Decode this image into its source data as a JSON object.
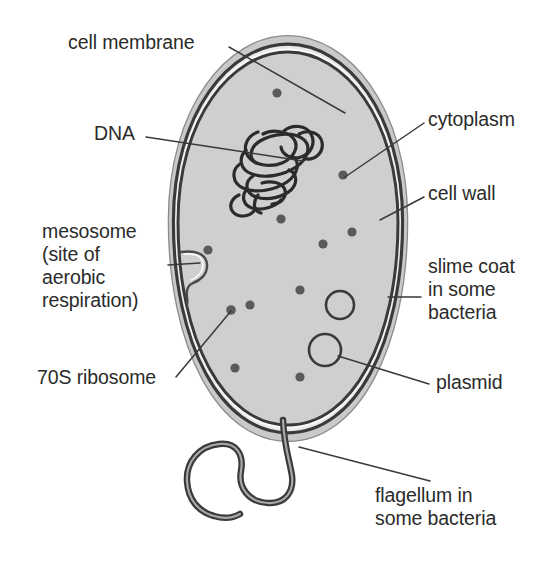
{
  "diagram": {
    "background_color": "#ffffff",
    "ink_color": "#2b2b2b",
    "cytoplasm_color": "#cfcfcf",
    "slime_coat_color": "#c8c8c8",
    "membrane_color": "#3a3a3a",
    "wall_color": "#3a3a3a",
    "ribosome_color": "#555555"
  },
  "labels": {
    "cell_membrane": "cell membrane",
    "dna": "DNA",
    "mesosome_line1": "mesosome",
    "mesosome_line2": "(site of",
    "mesosome_line3": "aerobic",
    "mesosome_line4": "respiration)",
    "ribosome": "70S ribosome",
    "cytoplasm": "cytoplasm",
    "cell_wall": "cell wall",
    "slime_coat_line1": "slime coat",
    "slime_coat_line2": "in some",
    "slime_coat_line3": "bacteria",
    "plasmid": "plasmid",
    "flagellum_line1": "flagellum in",
    "flagellum_line2": "some bacteria"
  },
  "structures": {
    "cell_body": {
      "name": "bacterial cell",
      "shape": "ovoid",
      "bounds": [
        178,
        52,
        220,
        373
      ]
    },
    "ribosomes": {
      "name": "70S ribosome",
      "count": 11,
      "radius": 4.5,
      "points": [
        [
          277,
          93
        ],
        [
          343,
          175
        ],
        [
          208,
          250
        ],
        [
          323,
          244
        ],
        [
          352,
          232
        ],
        [
          300,
          290
        ],
        [
          231,
          310
        ],
        [
          250,
          307
        ],
        [
          235,
          368
        ],
        [
          300,
          377
        ],
        [
          281,
          219
        ]
      ]
    },
    "plasmids": {
      "name": "plasmid",
      "count": 2,
      "circles": [
        {
          "cx": 340,
          "cy": 305,
          "r": 14
        },
        {
          "cx": 325,
          "cy": 350,
          "r": 16
        }
      ]
    },
    "nucleoid": {
      "name": "DNA",
      "center": [
        272,
        158
      ],
      "description": "tangled circular chromosome"
    },
    "mesosome": {
      "name": "mesosome",
      "anchor": [
        200,
        262
      ],
      "description": "membrane infolding hook"
    },
    "flagellum": {
      "name": "flagellum",
      "origin": [
        288,
        425
      ],
      "description": "single sinuous tail curving down and left"
    }
  },
  "leader_lines": [
    {
      "label": "cell membrane",
      "from": [
        228,
        48
      ],
      "to": [
        340,
        110
      ]
    },
    {
      "label": "DNA",
      "from": [
        146,
        136
      ],
      "to": [
        300,
        160
      ]
    },
    {
      "label": "mesosome",
      "from": [
        175,
        265
      ],
      "to": [
        200,
        264
      ]
    },
    {
      "label": "70S ribosome",
      "from": [
        176,
        378
      ],
      "to": [
        231,
        311
      ]
    },
    {
      "label": "cytoplasm",
      "from": [
        424,
        122
      ],
      "to": [
        344,
        176
      ]
    },
    {
      "label": "cell wall",
      "from": [
        424,
        196
      ],
      "to": [
        379,
        219
      ]
    },
    {
      "label": "slime coat",
      "from": [
        420,
        298
      ],
      "to": [
        389,
        298
      ]
    },
    {
      "label": "plasmid",
      "from": [
        430,
        385
      ],
      "to": [
        339,
        355
      ]
    },
    {
      "label": "flagellum",
      "from": [
        432,
        482
      ],
      "to": [
        300,
        447
      ]
    }
  ]
}
